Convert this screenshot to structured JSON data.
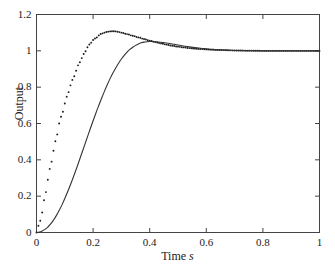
{
  "chart_data": {
    "type": "line",
    "title": "",
    "xlabel": "Time",
    "xlabel_unit": "s",
    "ylabel": "Output",
    "xlim": [
      0,
      1
    ],
    "ylim": [
      0,
      1.2
    ],
    "grid": false,
    "legend": "none",
    "frame": "box",
    "tick_direction": "in",
    "xticks": [
      0,
      0.2,
      0.4,
      0.6,
      0.8,
      1
    ],
    "xtick_labels": [
      "0",
      "0.2",
      "0.4",
      "0.6",
      "0.8",
      "1"
    ],
    "yticks": [
      0,
      0.2,
      0.4,
      0.6,
      0.8,
      1,
      1.2
    ],
    "ytick_labels": [
      "0",
      "0.2",
      "0.4",
      "0.6",
      "0.8",
      "1",
      "1.2"
    ],
    "series": [
      {
        "name": "fast response",
        "style": "dotted",
        "marker": "dot",
        "color": "#1a1a1a",
        "overshoot_pct": 10,
        "peak_time": 0.27,
        "peak_value": 1.1,
        "final_value": 1.0,
        "x": [
          0,
          0.01,
          0.02,
          0.03,
          0.04,
          0.05,
          0.06,
          0.07,
          0.08,
          0.09,
          0.1,
          0.11,
          0.12,
          0.13,
          0.14,
          0.15,
          0.16,
          0.17,
          0.18,
          0.19,
          0.2,
          0.21,
          0.22,
          0.23,
          0.24,
          0.25,
          0.26,
          0.27,
          0.28,
          0.29,
          0.3,
          0.32,
          0.34,
          0.36,
          0.38,
          0.4,
          0.42,
          0.44,
          0.46,
          0.48,
          0.5,
          0.52,
          0.54,
          0.56,
          0.58,
          0.6,
          0.62,
          0.64,
          0.66,
          0.68,
          0.7,
          0.75,
          0.8,
          0.85,
          0.9,
          0.95,
          1
        ],
        "y": [
          0,
          0.05,
          0.11,
          0.2,
          0.29,
          0.37,
          0.45,
          0.52,
          0.6,
          0.65,
          0.71,
          0.76,
          0.81,
          0.85,
          0.89,
          0.93,
          0.96,
          0.99,
          1.02,
          1.04,
          1.06,
          1.07,
          1.085,
          1.095,
          1.1,
          1.105,
          1.107,
          1.108,
          1.107,
          1.104,
          1.1,
          1.092,
          1.083,
          1.074,
          1.065,
          1.056,
          1.048,
          1.041,
          1.034,
          1.028,
          1.023,
          1.019,
          1.015,
          1.012,
          1.01,
          1.008,
          1.006,
          1.005,
          1.004,
          1.003,
          1.002,
          1.001,
          1.0,
          1.0,
          1.0,
          1.0,
          1.0
        ]
      },
      {
        "name": "slow response",
        "style": "solid",
        "marker": "none",
        "color": "#333333",
        "overshoot_pct": 5,
        "peak_time": 0.42,
        "peak_value": 1.05,
        "final_value": 1.0,
        "x": [
          0,
          0.01,
          0.02,
          0.03,
          0.04,
          0.05,
          0.06,
          0.07,
          0.08,
          0.09,
          0.1,
          0.11,
          0.12,
          0.13,
          0.14,
          0.15,
          0.16,
          0.17,
          0.18,
          0.19,
          0.2,
          0.21,
          0.22,
          0.23,
          0.24,
          0.25,
          0.26,
          0.27,
          0.28,
          0.29,
          0.3,
          0.31,
          0.32,
          0.33,
          0.34,
          0.35,
          0.36,
          0.37,
          0.38,
          0.39,
          0.4,
          0.41,
          0.42,
          0.43,
          0.44,
          0.45,
          0.46,
          0.48,
          0.5,
          0.52,
          0.54,
          0.56,
          0.58,
          0.6,
          0.62,
          0.64,
          0.66,
          0.68,
          0.7,
          0.75,
          0.8,
          0.85,
          0.9,
          0.95,
          1
        ],
        "y": [
          0,
          0.002,
          0.008,
          0.017,
          0.03,
          0.047,
          0.068,
          0.093,
          0.121,
          0.152,
          0.187,
          0.224,
          0.263,
          0.304,
          0.347,
          0.391,
          0.436,
          0.481,
          0.526,
          0.571,
          0.615,
          0.658,
          0.699,
          0.739,
          0.777,
          0.813,
          0.847,
          0.878,
          0.906,
          0.932,
          0.955,
          0.975,
          0.993,
          1.008,
          1.02,
          1.03,
          1.038,
          1.044,
          1.048,
          1.05,
          1.051,
          1.051,
          1.05,
          1.049,
          1.047,
          1.045,
          1.043,
          1.038,
          1.032,
          1.027,
          1.022,
          1.018,
          1.014,
          1.011,
          1.008,
          1.006,
          1.005,
          1.003,
          1.002,
          1.001,
          1.0,
          1.0,
          1.0,
          1.0,
          1.0
        ]
      }
    ]
  }
}
